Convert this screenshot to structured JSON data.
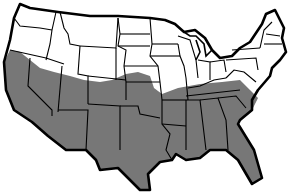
{
  "map": {
    "title": "Continental United States — shaded southern region",
    "region": "Contiguous United States",
    "legend": [],
    "colors": {
      "background": "#ffffff",
      "land": "#ffffff",
      "shaded": "#777777",
      "border": "#000000"
    },
    "shaded_region_description": "Southern US: California, Nevada, Arizona, New Mexico, Texas, Oklahoma, southern Utah/Colorado/Kansas, Arkansas, Louisiana, Mississippi, Alabama, Georgia, South Carolina, Florida, southern Tennessee/Missouri",
    "shaded_states": [
      "California",
      "Nevada",
      "Arizona",
      "New Mexico",
      "Texas",
      "Oklahoma",
      "Arkansas",
      "Louisiana",
      "Mississippi",
      "Alabama",
      "Georgia",
      "South Carolina",
      "Florida"
    ],
    "partially_shaded_states": [
      "Oregon",
      "Idaho",
      "Utah",
      "Colorado",
      "Kansas",
      "Missouri",
      "Tennessee",
      "North Carolina"
    ]
  }
}
